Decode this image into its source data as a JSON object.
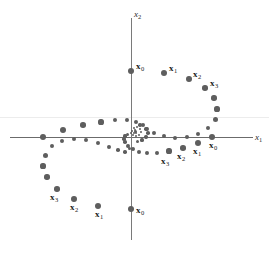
{
  "figure": {
    "width": 269,
    "height": 262,
    "background": "#ffffff",
    "dot_color": "#5e5e5e",
    "axis_color": "#6b6b6b",
    "label_color": "#1b1b1b"
  },
  "axes": {
    "x_label": "x",
    "x_label_sub": "1",
    "y_label": "x",
    "y_label_sub": "2",
    "origin_px": [
      131,
      137
    ],
    "x_axis_y_px": 137,
    "y_axis_x_px": 131,
    "x_axis_extent_px": [
      10,
      253
    ],
    "y_axis_extent_px": [
      18,
      240
    ]
  },
  "chart_data": {
    "type": "scatter",
    "title": "",
    "xlabel": "x1",
    "ylabel": "x2",
    "grid": false,
    "legend": null,
    "axis_ranges": {
      "xlim": [
        -1.3,
        1.3
      ],
      "ylim": [
        -1.3,
        1.3
      ]
    },
    "series": [
      {
        "name": "trajectory-from-positive-x-axis",
        "labeled_points": [
          "x0",
          "x1",
          "x2",
          "x3"
        ],
        "points_px": [
          [
            212,
            137
          ],
          [
            198,
            143
          ],
          [
            183,
            148
          ],
          [
            169,
            151
          ],
          [
            157,
            153
          ],
          [
            146,
            153
          ],
          [
            138,
            151
          ],
          [
            132,
            148
          ],
          [
            127,
            144
          ],
          [
            125,
            140
          ],
          [
            124,
            137
          ],
          [
            125,
            134
          ],
          [
            127,
            132
          ],
          [
            130,
            130
          ]
        ]
      },
      {
        "name": "trajectory-from-positive-y-axis",
        "labeled_points": [
          "x0",
          "x1",
          "x2",
          "x3"
        ],
        "points_px": [
          [
            131,
            71
          ],
          [
            164,
            73
          ],
          [
            189,
            79
          ],
          [
            206,
            88
          ],
          [
            216,
            99
          ],
          [
            219,
            111
          ],
          [
            216,
            122
          ],
          [
            209,
            130
          ],
          [
            199,
            135
          ],
          [
            188,
            137
          ],
          [
            176,
            137
          ],
          [
            165,
            135
          ],
          [
            155,
            132
          ],
          [
            147,
            128
          ],
          [
            141,
            124
          ],
          [
            137,
            130
          ]
        ]
      },
      {
        "name": "trajectory-from-negative-x-axis",
        "labeled_points": [
          "x0",
          "x1",
          "x2",
          "x3"
        ],
        "points_px": [
          [
            43,
            137
          ],
          [
            63,
            130
          ],
          [
            83,
            125
          ],
          [
            101,
            122
          ],
          [
            116,
            120
          ],
          [
            128,
            120
          ],
          [
            137,
            122
          ],
          [
            144,
            126
          ],
          [
            148,
            130
          ],
          [
            149,
            134
          ],
          [
            147,
            138
          ],
          [
            143,
            141
          ],
          [
            138,
            142
          ],
          [
            133,
            142
          ]
        ]
      },
      {
        "name": "trajectory-from-negative-y-axis",
        "labeled_points": [
          "x0",
          "x1",
          "x2",
          "x3"
        ],
        "points_px": [
          [
            131,
            209
          ],
          [
            98,
            206
          ],
          [
            74,
            199
          ],
          [
            57,
            189
          ],
          [
            47,
            177
          ],
          [
            43,
            165
          ],
          [
            45,
            154
          ],
          [
            52,
            146
          ],
          [
            62,
            141
          ],
          [
            74,
            139
          ],
          [
            86,
            139
          ],
          [
            98,
            141
          ],
          [
            108,
            144
          ],
          [
            117,
            148
          ],
          [
            123,
            151
          ],
          [
            127,
            147
          ]
        ]
      }
    ]
  },
  "dots": [
    {
      "name": "dot-traj1-x0",
      "x": 212,
      "y": 137,
      "r": 3.2
    },
    {
      "name": "dot-traj1-x1",
      "x": 198,
      "y": 143,
      "r": 3.0
    },
    {
      "name": "dot-traj1-x2",
      "x": 183,
      "y": 148,
      "r": 2.8
    },
    {
      "name": "dot-traj1-x3",
      "x": 169,
      "y": 151,
      "r": 2.6
    },
    {
      "name": "dot-traj1-4",
      "x": 157,
      "y": 153,
      "r": 2.4
    },
    {
      "name": "dot-traj1-5",
      "x": 147,
      "y": 153,
      "r": 2.2
    },
    {
      "name": "dot-traj1-6",
      "x": 139,
      "y": 152,
      "r": 2.1
    },
    {
      "name": "dot-traj1-7",
      "x": 133,
      "y": 149,
      "r": 2.0
    },
    {
      "name": "dot-traj1-8",
      "x": 128,
      "y": 146,
      "r": 1.9
    },
    {
      "name": "dot-traj1-9",
      "x": 125,
      "y": 142,
      "r": 1.8
    },
    {
      "name": "dot-traj1-10",
      "x": 124,
      "y": 139,
      "r": 1.7
    },
    {
      "name": "dot-traj1-11",
      "x": 125,
      "y": 136,
      "r": 1.6
    },
    {
      "name": "dot-traj1-12",
      "x": 127,
      "y": 134,
      "r": 1.5
    },
    {
      "name": "dot-traj2-x0",
      "x": 131,
      "y": 71,
      "r": 3.2
    },
    {
      "name": "dot-traj2-x1",
      "x": 164,
      "y": 73,
      "r": 3.0
    },
    {
      "name": "dot-traj2-x2",
      "x": 189,
      "y": 79,
      "r": 2.9
    },
    {
      "name": "dot-traj2-x3",
      "x": 205,
      "y": 88,
      "r": 2.8
    },
    {
      "name": "dot-traj2-4",
      "x": 214,
      "y": 98,
      "r": 2.7
    },
    {
      "name": "dot-traj2-5",
      "x": 217,
      "y": 109,
      "r": 2.6
    },
    {
      "name": "dot-traj2-6",
      "x": 215,
      "y": 119,
      "r": 2.5
    },
    {
      "name": "dot-traj2-7",
      "x": 208,
      "y": 128,
      "r": 2.4
    },
    {
      "name": "dot-traj2-8",
      "x": 198,
      "y": 134,
      "r": 2.3
    },
    {
      "name": "dot-traj2-9",
      "x": 187,
      "y": 137,
      "r": 2.2
    },
    {
      "name": "dot-traj2-10",
      "x": 175,
      "y": 138,
      "r": 2.1
    },
    {
      "name": "dot-traj2-11",
      "x": 164,
      "y": 136,
      "r": 2.0
    },
    {
      "name": "dot-traj2-12",
      "x": 154,
      "y": 133,
      "r": 1.9
    },
    {
      "name": "dot-traj2-13",
      "x": 146,
      "y": 129,
      "r": 1.8
    },
    {
      "name": "dot-traj2-14",
      "x": 140,
      "y": 125,
      "r": 1.7
    },
    {
      "name": "dot-traj2-15",
      "x": 135,
      "y": 131,
      "r": 1.5
    },
    {
      "name": "dot-traj3-x0",
      "x": 43,
      "y": 137,
      "r": 3.2
    },
    {
      "name": "dot-traj3-x1",
      "x": 63,
      "y": 130,
      "r": 3.0
    },
    {
      "name": "dot-traj3-x2",
      "x": 83,
      "y": 125,
      "r": 2.8
    },
    {
      "name": "dot-traj3-x3",
      "x": 101,
      "y": 122,
      "r": 2.6
    },
    {
      "name": "dot-traj3-4",
      "x": 115,
      "y": 120,
      "r": 2.4
    },
    {
      "name": "dot-traj3-5",
      "x": 127,
      "y": 120,
      "r": 2.2
    },
    {
      "name": "dot-traj3-6",
      "x": 136,
      "y": 122,
      "r": 2.1
    },
    {
      "name": "dot-traj3-7",
      "x": 143,
      "y": 125,
      "r": 2.0
    },
    {
      "name": "dot-traj3-8",
      "x": 147,
      "y": 129,
      "r": 1.9
    },
    {
      "name": "dot-traj3-9",
      "x": 148,
      "y": 133,
      "r": 1.8
    },
    {
      "name": "dot-traj3-10",
      "x": 146,
      "y": 137,
      "r": 1.7
    },
    {
      "name": "dot-traj3-11",
      "x": 142,
      "y": 140,
      "r": 1.6
    },
    {
      "name": "dot-traj3-12",
      "x": 137,
      "y": 141,
      "r": 1.5
    },
    {
      "name": "dot-traj4-x0",
      "x": 131,
      "y": 209,
      "r": 3.2
    },
    {
      "name": "dot-traj4-x1",
      "x": 98,
      "y": 206,
      "r": 3.0
    },
    {
      "name": "dot-traj4-x2",
      "x": 74,
      "y": 199,
      "r": 2.9
    },
    {
      "name": "dot-traj4-x3",
      "x": 57,
      "y": 189,
      "r": 2.8
    },
    {
      "name": "dot-traj4-4",
      "x": 47,
      "y": 177,
      "r": 2.7
    },
    {
      "name": "dot-traj4-5",
      "x": 43,
      "y": 166,
      "r": 2.6
    },
    {
      "name": "dot-traj4-6",
      "x": 45,
      "y": 155,
      "r": 2.5
    },
    {
      "name": "dot-traj4-7",
      "x": 52,
      "y": 146,
      "r": 2.4
    },
    {
      "name": "dot-traj4-8",
      "x": 62,
      "y": 141,
      "r": 2.3
    },
    {
      "name": "dot-traj4-9",
      "x": 74,
      "y": 139,
      "r": 2.2
    },
    {
      "name": "dot-traj4-10",
      "x": 86,
      "y": 140,
      "r": 2.1
    },
    {
      "name": "dot-traj4-11",
      "x": 98,
      "y": 143,
      "r": 2.0
    },
    {
      "name": "dot-traj4-12",
      "x": 109,
      "y": 147,
      "r": 1.9
    },
    {
      "name": "dot-traj4-13",
      "x": 118,
      "y": 150,
      "r": 1.8
    },
    {
      "name": "dot-traj4-14",
      "x": 125,
      "y": 152,
      "r": 1.7
    },
    {
      "name": "dot-traj4-15",
      "x": 129,
      "y": 148,
      "r": 1.5
    },
    {
      "name": "dot-inner-a",
      "x": 134,
      "y": 128,
      "r": 1.4
    },
    {
      "name": "dot-inner-b",
      "x": 137,
      "y": 127,
      "r": 1.3
    },
    {
      "name": "dot-inner-c",
      "x": 140,
      "y": 129,
      "r": 1.3
    },
    {
      "name": "dot-inner-d",
      "x": 141,
      "y": 132,
      "r": 1.2
    },
    {
      "name": "dot-inner-e",
      "x": 139,
      "y": 135,
      "r": 1.2
    },
    {
      "name": "dot-inner-f",
      "x": 136,
      "y": 136,
      "r": 1.2
    },
    {
      "name": "dot-inner-g",
      "x": 133,
      "y": 135,
      "r": 1.1
    },
    {
      "name": "dot-inner-h",
      "x": 131,
      "y": 133,
      "r": 1.1
    },
    {
      "name": "dot-inner-i",
      "x": 132,
      "y": 131,
      "r": 1.1
    },
    {
      "name": "dot-inner-j",
      "x": 134,
      "y": 133,
      "r": 1.0
    },
    {
      "name": "dot-inner-k",
      "x": 136,
      "y": 133,
      "r": 1.0
    },
    {
      "name": "dot-inner-l",
      "x": 135,
      "y": 130,
      "r": 1.0
    }
  ],
  "labels": [
    {
      "name": "label-traj2-x0",
      "text": "x",
      "sub": "0",
      "x": 136,
      "y": 62,
      "bold": true
    },
    {
      "name": "label-traj2-x1",
      "text": "x",
      "sub": "1",
      "x": 169,
      "y": 64,
      "bold": true
    },
    {
      "name": "label-traj2-x2",
      "text": "x",
      "sub": "2",
      "x": 193,
      "y": 70,
      "bold": true
    },
    {
      "name": "label-traj2-x3",
      "text": "x",
      "sub": "3",
      "x": 210,
      "y": 79,
      "bold": true
    },
    {
      "name": "label-traj1-x0",
      "text": "x",
      "sub": "0",
      "x": 209,
      "y": 141,
      "bold": true
    },
    {
      "name": "label-traj1-x1",
      "text": "x",
      "sub": "1",
      "x": 193,
      "y": 147,
      "bold": true
    },
    {
      "name": "label-traj1-x2",
      "text": "x",
      "sub": "2",
      "x": 177,
      "y": 152,
      "bold": true
    },
    {
      "name": "label-traj1-x3",
      "text": "x",
      "sub": "3",
      "x": 161,
      "y": 157,
      "bold": true
    },
    {
      "name": "label-traj4-x0",
      "text": "x",
      "sub": "0",
      "x": 136,
      "y": 206,
      "bold": true
    },
    {
      "name": "label-traj4-x1",
      "text": "x",
      "sub": "1",
      "x": 95,
      "y": 210,
      "bold": true
    },
    {
      "name": "label-traj4-x2",
      "text": "x",
      "sub": "2",
      "x": 70,
      "y": 203,
      "bold": true
    },
    {
      "name": "label-traj4-x3",
      "text": "x",
      "sub": "3",
      "x": 50,
      "y": 193,
      "bold": true
    }
  ]
}
